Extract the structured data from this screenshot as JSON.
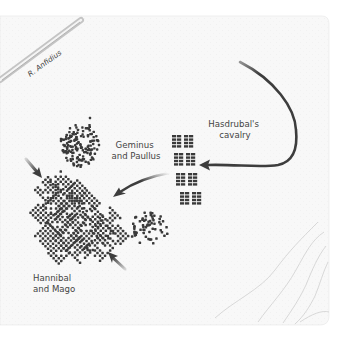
{
  "map": {
    "colors": {
      "paper": "#f8f8f8",
      "background": "#ffffff",
      "troops": "#3a3a3a",
      "arrow": "#3d3d3d",
      "river": "#b0b0b0",
      "contour": "#cfcfcf",
      "text": "#444444"
    },
    "river": {
      "name": "R. Anfidius"
    },
    "units": [
      {
        "id": "roman-rear",
        "label_lines": [
          "Geminus",
          "and Paullus"
        ]
      },
      {
        "id": "carthaginian-center",
        "label_lines": [
          "Hannibal",
          "and Mago"
        ]
      },
      {
        "id": "carthaginian-cavalry",
        "label_lines": [
          "Hasdrubal's",
          "cavalry"
        ]
      }
    ],
    "arrows": [
      {
        "id": "cavalry-sweep",
        "description": "Hasdrubal's cavalry loop from north-east into the Roman rear"
      },
      {
        "id": "cavalry-attack",
        "description": "Cavalry attack toward the Roman mass"
      },
      {
        "id": "flank-attack-northwest",
        "description": "Attack on the north-west flank"
      },
      {
        "id": "flank-attack-south",
        "description": "Attack from the south"
      }
    ]
  }
}
